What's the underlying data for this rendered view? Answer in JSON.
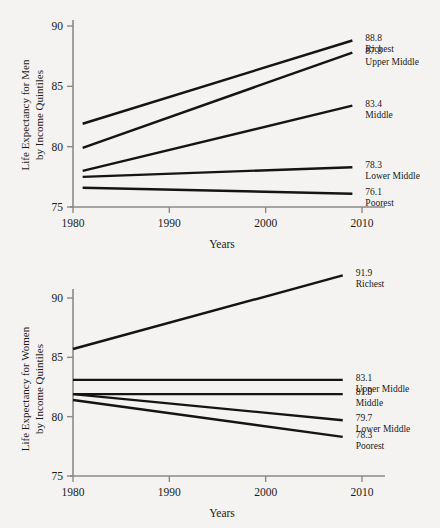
{
  "chart_data": [
    {
      "id": "men",
      "type": "line",
      "title": "",
      "ylabel": "Life Expectancy for Men\nby Income Quintiles",
      "ylabel_line1": "Life Expectancy for Men",
      "ylabel_line2": "by Income Quintiles",
      "xlabel": "Years",
      "xlim": [
        1980,
        2010
      ],
      "ylim": [
        75,
        90
      ],
      "xticks": [
        1980,
        1990,
        2000,
        2010
      ],
      "xticklabels": [
        "1980",
        "1990",
        "2000",
        "2010"
      ],
      "yticks": [
        75,
        80,
        85,
        90
      ],
      "yticklabels": [
        "75",
        "80",
        "85",
        "90"
      ],
      "grid": false,
      "legend": "right-end-labels",
      "x": [
        1981,
        2009
      ],
      "series": [
        {
          "name": "Richest",
          "values": [
            81.9,
            88.8
          ],
          "end_value_label": "88.8"
        },
        {
          "name": "Upper Middle",
          "values": [
            79.9,
            87.8
          ],
          "end_value_label": "87.8"
        },
        {
          "name": "Middle",
          "values": [
            78.0,
            83.4
          ],
          "end_value_label": "83.4"
        },
        {
          "name": "Lower Middle",
          "values": [
            77.5,
            78.3
          ],
          "end_value_label": "78.3"
        },
        {
          "name": "Poorest",
          "values": [
            76.6,
            76.1
          ],
          "end_value_label": "76.1"
        }
      ]
    },
    {
      "id": "women",
      "type": "line",
      "title": "",
      "ylabel": "Life Expectancy for Women\nby Income Quintiles",
      "ylabel_line1": "Life Expectancy for Women",
      "ylabel_line2": "by Income Quintiles",
      "xlabel": "Years",
      "xlim": [
        1980,
        2010
      ],
      "ylim": [
        75,
        92
      ],
      "xticks": [
        1980,
        1990,
        2000,
        2010
      ],
      "xticklabels": [
        "1980",
        "1990",
        "2000",
        "2010"
      ],
      "yticks": [
        75,
        80,
        85,
        90
      ],
      "yticklabels": [
        "75",
        "80",
        "85",
        "90"
      ],
      "grid": false,
      "legend": "right-end-labels",
      "x": [
        1980,
        2008
      ],
      "series": [
        {
          "name": "Richest",
          "values": [
            85.7,
            91.9
          ],
          "end_value_label": "91.9"
        },
        {
          "name": "Upper Middle",
          "values": [
            83.1,
            83.1
          ],
          "end_value_label": "83.1"
        },
        {
          "name": "Middle",
          "values": [
            81.9,
            81.9
          ],
          "end_value_label": "81.9"
        },
        {
          "name": "Lower Middle",
          "values": [
            81.9,
            79.7
          ],
          "end_value_label": "79.7"
        },
        {
          "name": "Poorest",
          "values": [
            81.4,
            78.3
          ],
          "end_value_label": "78.3"
        }
      ]
    }
  ]
}
